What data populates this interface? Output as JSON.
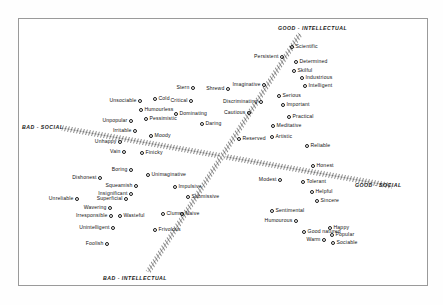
{
  "figure": {
    "type": "scatter-semantic-space",
    "background": "#ffffff",
    "frame_color": "#9a9a9a",
    "point_color": "#1a1a1a",
    "axis_hatch_color": "#2b2b2b"
  },
  "axes": {
    "good_intellectual": "GOOD - INTELLECTUAL",
    "bad_intellectual": "BAD - INTELLECTUAL",
    "good_social": "GOOD - SOCIAL",
    "bad_social": "BAD - SOCIAL"
  },
  "chart_data": {
    "type": "scatter",
    "title": "",
    "xlabel": "",
    "ylabel": "",
    "grid": false,
    "legend": false,
    "axis_lines": [
      {
        "name": "intellectual-axis",
        "from_label": "BAD - INTELLECTUAL",
        "to_label": "GOOD - INTELLECTUAL",
        "x1": 148,
        "y1": 272,
        "x2": 300,
        "y2": 34
      },
      {
        "name": "social-axis",
        "from_label": "BAD - SOCIAL",
        "to_label": "GOOD - SOCIAL",
        "x1": 62,
        "y1": 128,
        "x2": 392,
        "y2": 186
      }
    ],
    "points": [
      {
        "label": "Unsociable",
        "x": 140,
        "y": 101,
        "side": "left"
      },
      {
        "label": "Cold",
        "x": 155,
        "y": 99,
        "side": "right"
      },
      {
        "label": "Humourless",
        "x": 141,
        "y": 110,
        "side": "right"
      },
      {
        "label": "Unpopular",
        "x": 131,
        "y": 121,
        "side": "left"
      },
      {
        "label": "Pessimistic",
        "x": 146,
        "y": 119,
        "side": "right"
      },
      {
        "label": "Irritable",
        "x": 135,
        "y": 131,
        "side": "left"
      },
      {
        "label": "Moody",
        "x": 151,
        "y": 136,
        "side": "right"
      },
      {
        "label": "Unhappy",
        "x": 120,
        "y": 142,
        "side": "left"
      },
      {
        "label": "Vain",
        "x": 124,
        "y": 152,
        "side": "left"
      },
      {
        "label": "Finicky",
        "x": 142,
        "y": 153,
        "side": "right"
      },
      {
        "label": "Boring",
        "x": 131,
        "y": 170,
        "side": "left"
      },
      {
        "label": "Dishonest",
        "x": 100,
        "y": 178,
        "side": "left"
      },
      {
        "label": "Squeamish",
        "x": 136,
        "y": 186,
        "side": "left"
      },
      {
        "label": "Insignificant",
        "x": 131,
        "y": 194,
        "side": "left"
      },
      {
        "label": "Unreliable",
        "x": 77,
        "y": 199,
        "side": "left"
      },
      {
        "label": "Superficial",
        "x": 126,
        "y": 199,
        "side": "left"
      },
      {
        "label": "Wavering",
        "x": 110,
        "y": 208,
        "side": "left"
      },
      {
        "label": "Irresponsible",
        "x": 111,
        "y": 216,
        "side": "left"
      },
      {
        "label": "Wasteful",
        "x": 120,
        "y": 216,
        "side": "right"
      },
      {
        "label": "Unintelligent",
        "x": 113,
        "y": 228,
        "side": "left"
      },
      {
        "label": "Foolish",
        "x": 107,
        "y": 244,
        "side": "left"
      },
      {
        "label": "Unimaginative",
        "x": 148,
        "y": 175,
        "side": "right"
      },
      {
        "label": "Impulsive",
        "x": 175,
        "y": 187,
        "side": "right"
      },
      {
        "label": "Submissive",
        "x": 188,
        "y": 197,
        "side": "right"
      },
      {
        "label": "Clumsy",
        "x": 163,
        "y": 214,
        "side": "right"
      },
      {
        "label": "Naive",
        "x": 182,
        "y": 214,
        "side": "right"
      },
      {
        "label": "Frivolous",
        "x": 155,
        "y": 230,
        "side": "right"
      },
      {
        "label": "Stern",
        "x": 193,
        "y": 88,
        "side": "left"
      },
      {
        "label": "Critical",
        "x": 191,
        "y": 101,
        "side": "left"
      },
      {
        "label": "Dominating",
        "x": 176,
        "y": 114,
        "side": "right"
      },
      {
        "label": "Daring",
        "x": 202,
        "y": 124,
        "side": "right"
      },
      {
        "label": "Shrewd",
        "x": 228,
        "y": 89,
        "side": "left"
      },
      {
        "label": "Discriminating",
        "x": 261,
        "y": 102,
        "side": "left"
      },
      {
        "label": "Cautious",
        "x": 249,
        "y": 113,
        "side": "left"
      },
      {
        "label": "Reserved",
        "x": 239,
        "y": 139,
        "side": "right"
      },
      {
        "label": "Imaginative",
        "x": 264,
        "y": 85,
        "side": "left"
      },
      {
        "label": "Serious",
        "x": 279,
        "y": 96,
        "side": "right"
      },
      {
        "label": "Important",
        "x": 283,
        "y": 105,
        "side": "right"
      },
      {
        "label": "Practical",
        "x": 289,
        "y": 117,
        "side": "right"
      },
      {
        "label": "Meditative",
        "x": 273,
        "y": 126,
        "side": "right"
      },
      {
        "label": "Artistic",
        "x": 272,
        "y": 137,
        "side": "right"
      },
      {
        "label": "Reliable",
        "x": 307,
        "y": 146,
        "side": "right"
      },
      {
        "label": "Persistent",
        "x": 282,
        "y": 57,
        "side": "left"
      },
      {
        "label": "Scientific",
        "x": 292,
        "y": 47,
        "side": "right"
      },
      {
        "label": "Determined",
        "x": 296,
        "y": 62,
        "side": "right"
      },
      {
        "label": "Skilful",
        "x": 294,
        "y": 71,
        "side": "right"
      },
      {
        "label": "Industrious",
        "x": 302,
        "y": 78,
        "side": "right"
      },
      {
        "label": "Intelligent",
        "x": 305,
        "y": 86,
        "side": "right"
      },
      {
        "label": "Honest",
        "x": 313,
        "y": 166,
        "side": "right"
      },
      {
        "label": "Modest",
        "x": 280,
        "y": 180,
        "side": "left"
      },
      {
        "label": "Tolerant",
        "x": 303,
        "y": 182,
        "side": "right"
      },
      {
        "label": "Helpful",
        "x": 312,
        "y": 192,
        "side": "right"
      },
      {
        "label": "Sincere",
        "x": 317,
        "y": 201,
        "side": "right"
      },
      {
        "label": "Sentimental",
        "x": 272,
        "y": 211,
        "side": "right"
      },
      {
        "label": "Humourous",
        "x": 296,
        "y": 221,
        "side": "left"
      },
      {
        "label": "Good natured",
        "x": 304,
        "y": 232,
        "side": "right"
      },
      {
        "label": "Warm",
        "x": 324,
        "y": 240,
        "side": "left"
      },
      {
        "label": "Happy",
        "x": 330,
        "y": 228,
        "side": "right"
      },
      {
        "label": "Popular",
        "x": 332,
        "y": 235,
        "side": "right"
      },
      {
        "label": "Sociable",
        "x": 333,
        "y": 243,
        "side": "right"
      }
    ]
  }
}
